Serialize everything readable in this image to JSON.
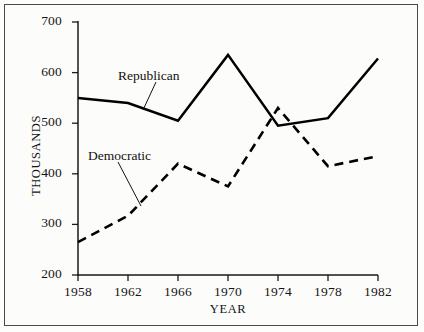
{
  "chart_data": {
    "type": "line",
    "title": "",
    "xlabel": "YEAR",
    "ylabel": "THOUSANDS",
    "x": [
      1958,
      1962,
      1966,
      1970,
      1974,
      1978,
      1982
    ],
    "xtick_labels": [
      "1958",
      "1962",
      "1966",
      "1970",
      "1974",
      "1978",
      "1982"
    ],
    "ytick_labels": [
      "200",
      "300",
      "400",
      "500",
      "600",
      "700"
    ],
    "yticks": [
      200,
      300,
      400,
      500,
      600,
      700
    ],
    "xlim": [
      1958,
      1982
    ],
    "ylim": [
      200,
      700
    ],
    "grid": false,
    "legend_position": "inline-annotations",
    "series": [
      {
        "name": "Republican",
        "style": "solid",
        "color": "#000000",
        "values": [
          550,
          540,
          505,
          635,
          495,
          510,
          628
        ]
      },
      {
        "name": "Democratic",
        "style": "dashed",
        "color": "#000000",
        "values": [
          265,
          317,
          420,
          375,
          530,
          415,
          435
        ]
      }
    ],
    "annotations": [
      {
        "text": "Republican",
        "series": "Republican"
      },
      {
        "text": "Democratic",
        "series": "Democratic"
      }
    ]
  },
  "axis": {
    "y_title": "THOUSANDS",
    "x_title": "YEAR"
  }
}
